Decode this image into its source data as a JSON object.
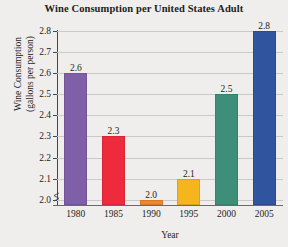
{
  "chart_data": {
    "type": "bar",
    "title": "Wine Consumption per United States Adult",
    "xlabel": "Year",
    "ylabel_line1": "Wine Consumption",
    "ylabel_line2": "(gallons per person)",
    "categories": [
      "1980",
      "1985",
      "1990",
      "1995",
      "2000",
      "2005"
    ],
    "values": [
      2.6,
      2.3,
      2.0,
      2.1,
      2.5,
      2.8
    ],
    "value_labels": [
      "2.6",
      "2.3",
      "2.0",
      "2.1",
      "2.5",
      "2.8"
    ],
    "bar_colors": [
      "#7f5fa8",
      "#ee2b3c",
      "#f0862e",
      "#f5b51e",
      "#3d8f7a",
      "#31549e"
    ],
    "ylim": [
      1.975,
      2.8
    ],
    "y_ticks": [
      2.0,
      2.1,
      2.2,
      2.3,
      2.4,
      2.5,
      2.6,
      2.7,
      2.8
    ],
    "y_tick_labels": [
      "2.0",
      "2.1",
      "2.2",
      "2.3",
      "2.4",
      "2.5",
      "2.6",
      "2.7",
      "2.8"
    ],
    "grid": true,
    "axis_break": true,
    "legend": "none",
    "legend_position": "none"
  },
  "figure": {
    "background_color": "#efeeec",
    "grid_color": "#c9c9c9",
    "axis_color": "#454545",
    "text_color": "#1d1d1d"
  }
}
